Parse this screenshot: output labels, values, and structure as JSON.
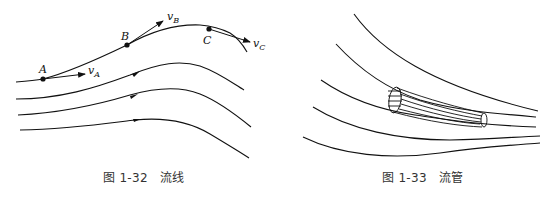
{
  "figures": [
    {
      "id": "fig-1-32",
      "caption_prefix": "图 1-32",
      "caption_title": "流线",
      "points": [
        {
          "label": "A",
          "velocity": "v",
          "velocity_sub": "A"
        },
        {
          "label": "B",
          "velocity": "v",
          "velocity_sub": "B"
        },
        {
          "label": "C",
          "velocity": "v",
          "velocity_sub": "C"
        }
      ],
      "streamline_count": 4
    },
    {
      "id": "fig-1-33",
      "caption_prefix": "图 1-33",
      "caption_title": "流管",
      "streamline_count": 5
    }
  ]
}
